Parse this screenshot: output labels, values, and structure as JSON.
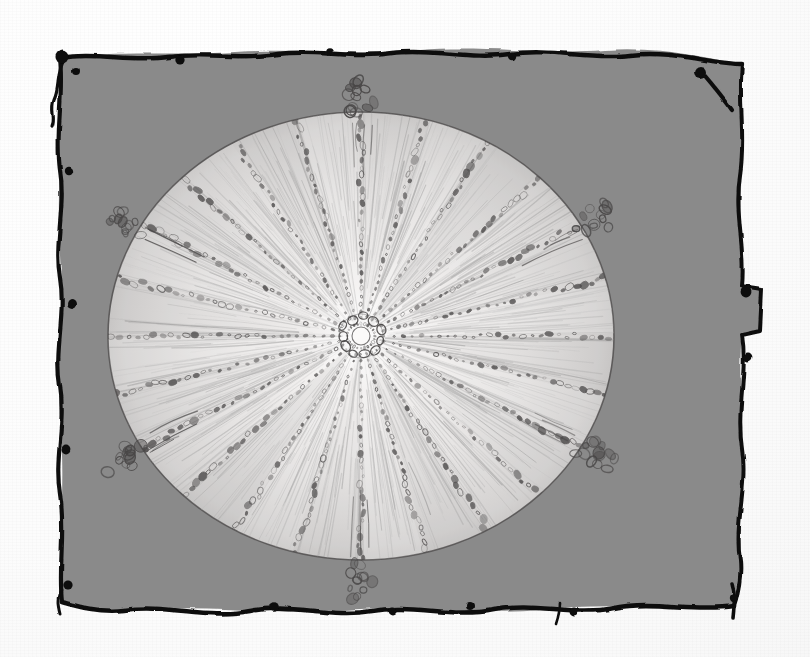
{
  "artwork": {
    "title": "Radial Disc Drawing",
    "medium": "graphite pencil and black ink on paper",
    "caption": "Scanned hand-drawn radial disc on a gray painted panel with irregular black ink border",
    "orientation": "landscape"
  },
  "canvas": {
    "width": 810,
    "height": 657,
    "paper_color": "#fdfdfd",
    "panel_color": "#8a8a8a",
    "ink_color": "#111111",
    "pencil_color": "#6f6f6f"
  },
  "panel": {
    "name": "gray-ink-bordered-panel",
    "fill": "#8a8a8a",
    "border_style": "hand-drawn irregular ink line with blobs",
    "bounds": {
      "left": 52,
      "top": 50,
      "right": 760,
      "bottom": 614
    },
    "notch": {
      "side": "right",
      "top": 288,
      "bottom": 332,
      "depth": 22
    }
  },
  "disc": {
    "name": "radial-disc",
    "center": {
      "x": 361,
      "y": 336
    },
    "radius_x": 253,
    "radius_y": 224,
    "fill": "#eceaea",
    "outline_color": "#5c5a5a",
    "spoke_count": 24,
    "hub": {
      "name": "center-rosette",
      "radius": 22,
      "bead_count": 11,
      "inner_radius": 9
    },
    "spoke": {
      "style": "dotted-dashed oval beads along each radius",
      "bead_min_rx": 1.6,
      "bead_max_rx": 4.6,
      "bead_color": "#4e4c4c"
    },
    "shading": {
      "style": "radial pencil hatching, light sectors alternating",
      "light": "#f6f5f4",
      "mid": "#d8d6d5",
      "dark": "#bdbbba"
    }
  },
  "tufts": [
    {
      "label": "top-tuft",
      "angle_deg": -90,
      "bead_count": 13
    },
    {
      "label": "upper-left-tuft",
      "angle_deg": -151,
      "bead_count": 12
    },
    {
      "label": "upper-right-tuft",
      "angle_deg": -29,
      "bead_count": 12
    },
    {
      "label": "lower-left-tuft",
      "angle_deg": 150,
      "bead_count": 13
    },
    {
      "label": "lower-right-tuft",
      "angle_deg": 29,
      "bead_count": 13
    },
    {
      "label": "bottom-tuft",
      "angle_deg": 90,
      "bead_count": 12
    }
  ],
  "ink_blobs": [
    {
      "x": 62,
      "y": 57,
      "r": 6.5
    },
    {
      "x": 76,
      "y": 71,
      "r": 4.0
    },
    {
      "x": 69,
      "y": 171,
      "r": 4.2
    },
    {
      "x": 72,
      "y": 304,
      "r": 5.0
    },
    {
      "x": 66,
      "y": 449,
      "r": 4.4
    },
    {
      "x": 68,
      "y": 585,
      "r": 4.6
    },
    {
      "x": 180,
      "y": 60,
      "r": 4.6
    },
    {
      "x": 330,
      "y": 52,
      "r": 3.8
    },
    {
      "x": 512,
      "y": 56,
      "r": 4.2
    },
    {
      "x": 700,
      "y": 72,
      "r": 6.0
    },
    {
      "x": 746,
      "y": 292,
      "r": 5.4
    },
    {
      "x": 748,
      "y": 357,
      "r": 4.4
    },
    {
      "x": 734,
      "y": 598,
      "r": 4.2
    },
    {
      "x": 274,
      "y": 607,
      "r": 4.8
    },
    {
      "x": 392,
      "y": 611,
      "r": 4.4
    },
    {
      "x": 470,
      "y": 606,
      "r": 4.0
    },
    {
      "x": 574,
      "y": 612,
      "r": 4.4
    }
  ],
  "layers": [
    {
      "name": "paper-background",
      "z": 0
    },
    {
      "name": "gray-panel",
      "z": 1
    },
    {
      "name": "ink-border",
      "z": 2
    },
    {
      "name": "disc-shading",
      "z": 3
    },
    {
      "name": "disc-spokes",
      "z": 4
    },
    {
      "name": "perimeter-tufts",
      "z": 5
    },
    {
      "name": "center-rosette",
      "z": 6
    }
  ]
}
